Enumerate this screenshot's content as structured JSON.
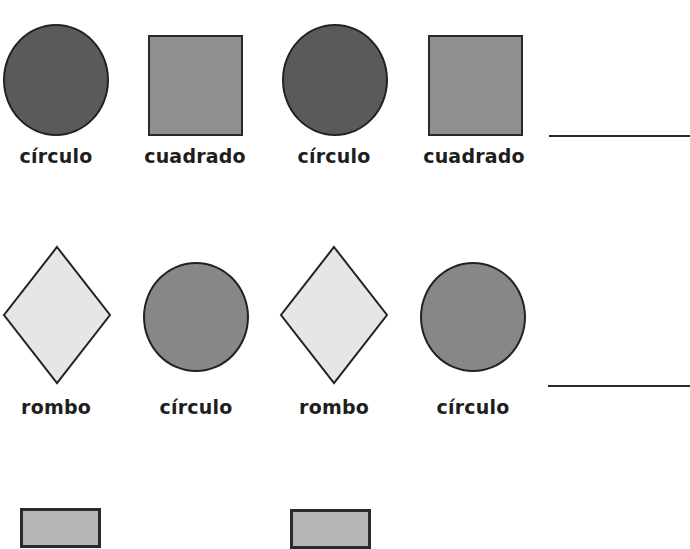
{
  "worksheet": {
    "rows": [
      {
        "items": [
          {
            "shape": "circle",
            "label": "círculo",
            "color": "#5a5a5a"
          },
          {
            "shape": "square",
            "label": "cuadrado",
            "color": "#8f8f8f"
          },
          {
            "shape": "circle",
            "label": "círculo",
            "color": "#5a5a5a"
          },
          {
            "shape": "square",
            "label": "cuadrado",
            "color": "#8f8f8f"
          }
        ],
        "answer_blank": ""
      },
      {
        "items": [
          {
            "shape": "rhombus",
            "label": "rombo",
            "color": "#e6e6e6"
          },
          {
            "shape": "circle",
            "label": "círculo",
            "color": "#878787"
          },
          {
            "shape": "rhombus",
            "label": "rombo",
            "color": "#e6e6e6"
          },
          {
            "shape": "circle",
            "label": "círculo",
            "color": "#878787"
          }
        ],
        "answer_blank": ""
      },
      {
        "items": [
          {
            "shape": "square",
            "label": "",
            "color": "#b5b5b5"
          },
          {
            "shape": "square",
            "label": "",
            "color": "#b5b5b5"
          }
        ]
      }
    ]
  }
}
